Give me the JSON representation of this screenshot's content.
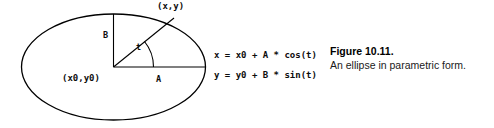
{
  "figure": {
    "caption_title": "Figure 10.11.",
    "caption_text": "An ellipse in parametric form.",
    "diagram": {
      "point_label": "(x,y)",
      "center_label": "(x0,y0)",
      "semi_minor_label": "B",
      "semi_major_label": "A",
      "angle_label": "t"
    },
    "equations": [
      "x = x0 + A * cos(t)",
      "y = y0 + B * sin(t)"
    ],
    "colors": {
      "stroke": "#000000",
      "text": "#0d0d0d",
      "background": "#ffffff"
    }
  }
}
